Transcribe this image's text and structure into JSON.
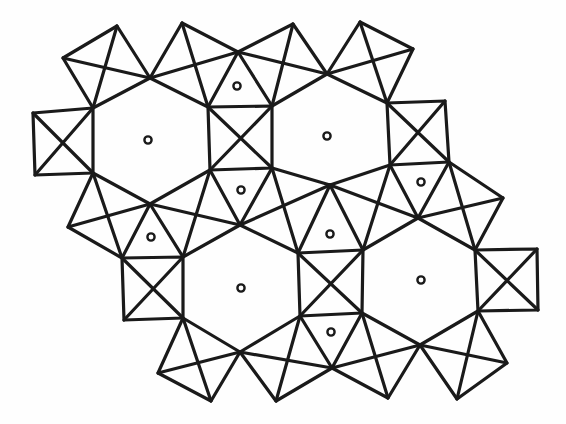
{
  "figure": {
    "type": "polyhedral-structure-diagram",
    "line_color": "#1a1a1a",
    "background_color": "#ffffff"
  },
  "vertices": {
    "T1": [
      117,
      26
    ],
    "T2": [
      182,
      23
    ],
    "T3": [
      293,
      24
    ],
    "T4": [
      360,
      22
    ],
    "L1": [
      63,
      58
    ],
    "R1": [
      413,
      49
    ],
    "J1": [
      150,
      78
    ],
    "J2": [
      238,
      52
    ],
    "J3": [
      327,
      74
    ],
    "LS_TL": [
      33,
      113
    ],
    "LS_TR": [
      93,
      108
    ],
    "LS_BR": [
      93,
      173
    ],
    "LS_BL": [
      35,
      175
    ],
    "MS_TL": [
      208,
      107
    ],
    "MS_TR": [
      272,
      106
    ],
    "MS_BR": [
      272,
      168
    ],
    "MS_BL": [
      210,
      170
    ],
    "RS_TL": [
      387,
      103
    ],
    "RS_TR": [
      445,
      101
    ],
    "RS_BR": [
      449,
      162
    ],
    "RS_BL": [
      390,
      165
    ],
    "P1": [
      68,
      227
    ],
    "J4": [
      150,
      204
    ],
    "J5": [
      240,
      225
    ],
    "J6": [
      330,
      185
    ],
    "J7": [
      418,
      218
    ],
    "P2": [
      503,
      198
    ],
    "S4_TL": [
      122,
      258
    ],
    "S4_TR": [
      183,
      257
    ],
    "S4_BR": [
      183,
      318
    ],
    "S4_BL": [
      124,
      320
    ],
    "S5_TL": [
      298,
      253
    ],
    "S5_TR": [
      363,
      250
    ],
    "S5_BR": [
      362,
      313
    ],
    "S5_BL": [
      300,
      316
    ],
    "S6_TL": [
      475,
      250
    ],
    "S6_TR": [
      537,
      249
    ],
    "S6_BR": [
      538,
      310
    ],
    "S6_BL": [
      478,
      311
    ],
    "J8": [
      240,
      352
    ],
    "J9": [
      332,
      368
    ],
    "J10": [
      420,
      345
    ],
    "B1": [
      158,
      373
    ],
    "B2": [
      211,
      401
    ],
    "B3": [
      276,
      401
    ],
    "B4": [
      388,
      398
    ],
    "B5": [
      457,
      399
    ],
    "B6": [
      507,
      363
    ]
  },
  "squares": [
    [
      "LS_TL",
      "LS_TR",
      "LS_BR",
      "LS_BL"
    ],
    [
      "MS_TL",
      "MS_TR",
      "MS_BR",
      "MS_BL"
    ],
    [
      "RS_TL",
      "RS_TR",
      "RS_BR",
      "RS_BL"
    ],
    [
      "S4_TL",
      "S4_TR",
      "S4_BR",
      "S4_BL"
    ],
    [
      "S5_TL",
      "S5_TR",
      "S5_BR",
      "S5_BL"
    ],
    [
      "S6_TL",
      "S6_TR",
      "S6_BR",
      "S6_BL"
    ]
  ],
  "diamonds": [
    [
      "L1",
      "T1",
      "J1",
      "LS_TR"
    ],
    [
      "J1",
      "T2",
      "J2",
      "MS_TL"
    ],
    [
      "J2",
      "T3",
      "J3",
      "MS_TR"
    ],
    [
      "J3",
      "T4",
      "R1",
      "RS_TL"
    ],
    [
      "LS_BR",
      "J4",
      "S4_TL",
      "P1"
    ],
    [
      "MS_BL",
      "J5",
      "S4_TR",
      "J4"
    ],
    [
      "MS_BR",
      "J6",
      "S5_TL",
      "J5"
    ],
    [
      "RS_BL",
      "J7",
      "S5_TR",
      "J6"
    ],
    [
      "RS_BR",
      "P2",
      "S6_TL",
      "J7"
    ],
    [
      "S4_BR",
      "J8",
      "B2",
      "B1"
    ],
    [
      "S5_BL",
      "J9",
      "B3",
      "J8"
    ],
    [
      "S5_BR",
      "J10",
      "B4",
      "J9"
    ],
    [
      "S6_BL",
      "B6",
      "B5",
      "J10"
    ]
  ],
  "cation_sites": [
    {
      "kind": "hexagonal-channel",
      "x": 148,
      "y": 140
    },
    {
      "kind": "hexagonal-channel",
      "x": 327,
      "y": 136
    },
    {
      "kind": "hexagonal-channel",
      "x": 241,
      "y": 288
    },
    {
      "kind": "hexagonal-channel",
      "x": 421,
      "y": 280
    },
    {
      "kind": "triangular-site",
      "x": 237,
      "y": 86
    },
    {
      "kind": "triangular-site",
      "x": 241,
      "y": 190
    },
    {
      "kind": "triangular-site",
      "x": 151,
      "y": 237
    },
    {
      "kind": "triangular-site",
      "x": 330,
      "y": 234
    },
    {
      "kind": "triangular-site",
      "x": 421,
      "y": 182
    },
    {
      "kind": "triangular-site",
      "x": 331,
      "y": 332
    }
  ]
}
